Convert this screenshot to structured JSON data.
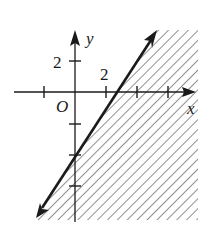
{
  "diagram": {
    "type": "linear-inequality-graph",
    "axes": {
      "x_label": "x",
      "y_label": "y",
      "origin_label": "O",
      "x_tick_label": "2",
      "y_tick_label": "2",
      "tick_spacing_units": 2
    },
    "boundary_line": {
      "style": "solid",
      "passes_through": [
        [
          0,
          -4
        ],
        [
          2.5,
          0
        ]
      ],
      "arrows": "both-ends"
    },
    "shaded_region": "right-of-line (below/right)",
    "colors": {
      "ink": "#1a1a1a",
      "background": "#ffffff"
    }
  }
}
